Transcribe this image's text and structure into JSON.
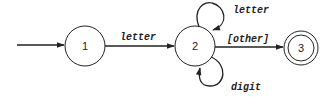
{
  "diagram": {
    "type": "finite-state-automaton",
    "states": [
      {
        "id": "1",
        "label": "1",
        "start": true,
        "accepting": false
      },
      {
        "id": "2",
        "label": "2",
        "start": false,
        "accepting": false
      },
      {
        "id": "3",
        "label": "3",
        "start": false,
        "accepting": true
      }
    ],
    "transitions": [
      {
        "from": "1",
        "to": "2",
        "label": "letter"
      },
      {
        "from": "2",
        "to": "2",
        "label": "letter",
        "position": "top"
      },
      {
        "from": "2",
        "to": "2",
        "label": "digit",
        "position": "bottom"
      },
      {
        "from": "2",
        "to": "3",
        "label": "[other]"
      }
    ]
  }
}
